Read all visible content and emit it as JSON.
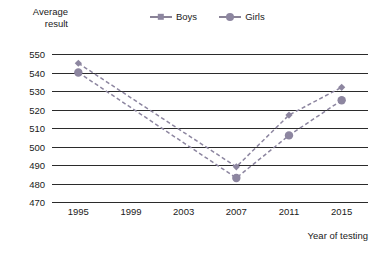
{
  "chart_data": {
    "type": "line",
    "title": "",
    "xlabel": "Year of testing",
    "ylabel": "Average result",
    "ylabel_lines": [
      "Average",
      "result"
    ],
    "categories": [
      "1995",
      "1999",
      "2003",
      "2007",
      "2011",
      "2015"
    ],
    "x_ticks": [
      "1995",
      "1999",
      "2003",
      "2007",
      "2011",
      "2015"
    ],
    "y_ticks": [
      "550",
      "540",
      "530",
      "520",
      "510",
      "500",
      "490",
      "480",
      "470"
    ],
    "ylim": [
      470,
      550
    ],
    "grid": "horizontal",
    "legend_position": "top-center",
    "line_style": "dashed",
    "series": [
      {
        "name": "Boys",
        "marker": "diamond",
        "color": "#8d86a0",
        "points": [
          {
            "x": "1995",
            "y": 545
          },
          {
            "x": "2007",
            "y": 489
          },
          {
            "x": "2011",
            "y": 517
          },
          {
            "x": "2015",
            "y": 532
          }
        ]
      },
      {
        "name": "Girls",
        "marker": "circle",
        "color": "#8d86a0",
        "points": [
          {
            "x": "1995",
            "y": 540
          },
          {
            "x": "2007",
            "y": 483
          },
          {
            "x": "2011",
            "y": 506
          },
          {
            "x": "2015",
            "y": 525
          }
        ]
      }
    ],
    "colors": {
      "axis": "#2b2b2b",
      "text": "#1a1a1a",
      "series": "#8d86a0",
      "background": "#ffffff"
    }
  }
}
